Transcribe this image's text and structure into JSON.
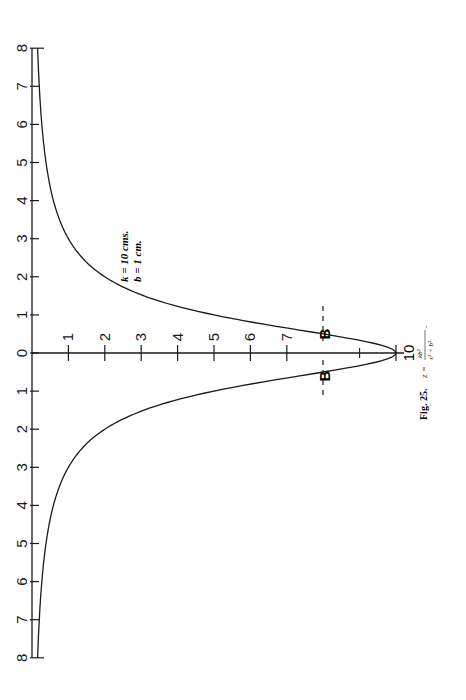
{
  "figure": {
    "caption_label": "Fig. 25.",
    "formula": {
      "lhs": "z =",
      "numerator": "kb²",
      "denominator": "x² + b²",
      "suffix": "."
    },
    "params": [
      "k = 10 cms.",
      "b =  1 cm."
    ],
    "marker_label": "B",
    "peak_label": "10"
  },
  "chart_data": {
    "type": "line",
    "title": "",
    "caption": "Fig. 25.  z = kb²/(x² + b²)",
    "orientation": "rotated 90° (x-axis vertical on left, z-axis horizontal)",
    "xlabel": "x (cm)",
    "ylabel": "z (cm)",
    "x_ticks": [
      8,
      7,
      6,
      5,
      4,
      3,
      2,
      1,
      0,
      1,
      2,
      3,
      4,
      5,
      6,
      7,
      8
    ],
    "z_ticks": [
      1,
      2,
      3,
      4,
      5,
      6,
      7,
      10
    ],
    "xlim": [
      -8,
      8
    ],
    "ylim": [
      0,
      10
    ],
    "params": {
      "k": 10,
      "b": 1
    },
    "annotations": [
      "k = 10 cms.",
      "b = 1 cm.",
      "B - - - B (dashed line at z = 8)"
    ],
    "x": [
      -8,
      -7,
      -6,
      -5,
      -4,
      -3,
      -2,
      -1,
      -0.5,
      0,
      0.5,
      1,
      2,
      3,
      4,
      5,
      6,
      7,
      8
    ],
    "values": [
      0.15,
      0.2,
      0.27,
      0.38,
      0.59,
      1.0,
      2.0,
      5.0,
      8.0,
      10.0,
      8.0,
      5.0,
      2.0,
      1.0,
      0.59,
      0.38,
      0.27,
      0.2,
      0.15
    ],
    "grid": false,
    "legend": "none"
  },
  "layout": {
    "axis_x_px": 32,
    "origin_y_px": 353,
    "px_per_x_unit": 38.1,
    "px_per_z_unit": 36.4,
    "ink": "#1a1a1a"
  }
}
